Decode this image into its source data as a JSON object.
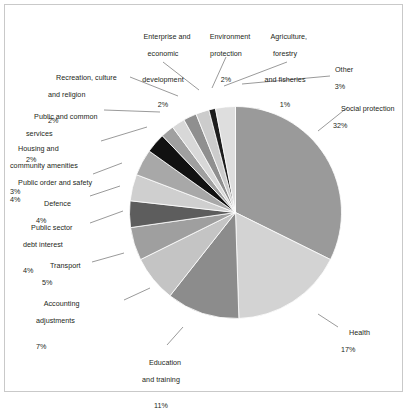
{
  "chart_data": {
    "type": "pie",
    "title": "",
    "subtitle": "",
    "xlabel": "",
    "ylabel": "",
    "legend_position": "none",
    "grid": false,
    "units": "percent",
    "labels": [
      "Social protection",
      "Health",
      "Education and training",
      "Accounting adjustments",
      "Transport",
      "Public sector debt interest",
      "Defence",
      "Public order and safety",
      "Housing and community amenities",
      "Public and common services",
      "Recreation, culture and religion",
      "Enterprise and economic development",
      "Environment protection",
      "Agriculture, forestry and fisheries",
      "Other"
    ],
    "values": [
      32,
      17,
      11,
      7,
      5,
      4,
      4,
      4,
      3,
      2,
      2,
      2,
      2,
      1,
      3
    ],
    "colors": [
      "#9a9a9a",
      "#d3d3d3",
      "#8c8c8c",
      "#c4c4c4",
      "#9f9f9f",
      "#5d5d5d",
      "#cfcfcf",
      "#a8a8a8",
      "#111111",
      "#a0a0a0",
      "#d8d8d8",
      "#8f8f8f",
      "#cccccc",
      "#1d1d1d",
      "#dedede"
    ]
  },
  "slices": [
    {
      "name": "social-protection",
      "label_line1": "Social protection",
      "pct": "32%",
      "value": 32,
      "color": "#9a9a9a"
    },
    {
      "name": "health",
      "label_line1": "Health",
      "pct": "17%",
      "value": 17,
      "color": "#d3d3d3"
    },
    {
      "name": "education-and-training",
      "label_line1": "Education",
      "label_line2": "and training",
      "pct": "11%",
      "value": 11,
      "color": "#8c8c8c"
    },
    {
      "name": "accounting-adjustments",
      "label_line1": "Accounting",
      "label_line2": "adjustments",
      "pct": "7%",
      "value": 7,
      "color": "#c4c4c4"
    },
    {
      "name": "transport",
      "label_line1": "Transport",
      "pct": "5%",
      "value": 5,
      "color": "#9f9f9f"
    },
    {
      "name": "public-sector-debt-interest",
      "label_line1": "Public sector",
      "label_line2": "debt interest",
      "pct": "4%",
      "value": 4,
      "color": "#5d5d5d"
    },
    {
      "name": "defence",
      "label_line1": "Defence",
      "pct": "4%",
      "value": 4,
      "color": "#cfcfcf"
    },
    {
      "name": "public-order-and-safety",
      "label_line1": "Public order and safety",
      "pct": "4%",
      "value": 4,
      "color": "#a8a8a8"
    },
    {
      "name": "housing-and-community-amenities",
      "label_line1": "Housing and",
      "label_line2": "community amenities",
      "pct": "3%",
      "value": 3,
      "color": "#111111"
    },
    {
      "name": "public-and-common-services",
      "label_line1": "Public and common",
      "label_line2": "services",
      "pct": "2%",
      "value": 2,
      "color": "#a0a0a0"
    },
    {
      "name": "recreation-culture-and-religion",
      "label_line1": "Recreation, culture",
      "label_line2": "and religion",
      "pct": "2%",
      "value": 2,
      "color": "#d8d8d8"
    },
    {
      "name": "enterprise-and-economic-development",
      "label_line1": "Enterprise and",
      "label_line2": "economic",
      "label_line3": "development",
      "pct": "2%",
      "value": 2,
      "color": "#8f8f8f"
    },
    {
      "name": "environment-protection",
      "label_line1": "Environment",
      "label_line2": "protection",
      "pct": "2%",
      "value": 2,
      "color": "#cccccc"
    },
    {
      "name": "agriculture-forestry-and-fisheries",
      "label_line1": "Agriculture,",
      "label_line2": "forestry",
      "label_line3": "and fisheries",
      "pct": "1%",
      "value": 1,
      "color": "#1d1d1d"
    },
    {
      "name": "other",
      "label_line1": "Other",
      "pct": "3%",
      "value": 3,
      "color": "#dedede"
    }
  ]
}
